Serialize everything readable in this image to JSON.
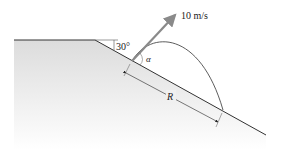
{
  "figure": {
    "velocity_label": "10 m/s",
    "slope_angle_label": "30°",
    "launch_angle_label": "α",
    "range_label": "R"
  },
  "colors": {
    "line": "#333333",
    "ground_fill": "#e6e6e6",
    "arrow": "#8a8a8a"
  }
}
